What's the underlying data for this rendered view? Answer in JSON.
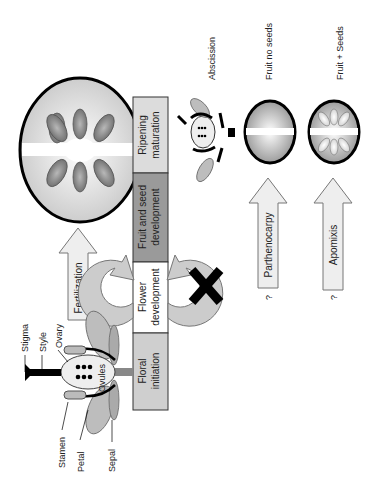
{
  "timeline": {
    "stages": [
      {
        "label_line1": "Ripening",
        "label_line2": "maturation",
        "color": "#dcdcdc"
      },
      {
        "label_line1": "Fruit and seed",
        "label_line2": "development",
        "color": "#9a9a9a"
      },
      {
        "label_line1": "Flower",
        "label_line2": "development",
        "color": "#ffffff"
      },
      {
        "label_line1": "Floral",
        "label_line2": "initiation",
        "color": "#cfcfcf"
      }
    ]
  },
  "flower": {
    "labels": {
      "stigma": "Stigma",
      "style": "Style",
      "ovary": "Ovary",
      "ovules": "Ovules",
      "stamen": "Stamen",
      "petal": "Petal",
      "sepal": "Sepal"
    }
  },
  "arrows": {
    "fertilization": "Fertilization",
    "parthenocarpy": "Parthenocarpy",
    "apomixis": "Apomixis",
    "question_mark": "?"
  },
  "outcomes": {
    "abscission": "Abscission",
    "fruit_no_seeds": "Fruit no seeds",
    "fruit_seeds": "Fruit + Seeds"
  },
  "colors": {
    "outline": "#000000",
    "arrow_fill": "#eeeeee",
    "cycle_arrow": "#cccccc",
    "seed": "#777777"
  }
}
